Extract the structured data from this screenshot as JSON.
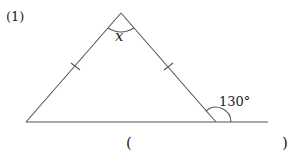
{
  "problem": {
    "number": "(1)",
    "unknown_label": "x",
    "exterior_angle": "130°",
    "answer_open": "(",
    "answer_close": ")"
  },
  "figure": {
    "type": "isosceles-triangle",
    "equal_sides_marked": true,
    "color": "#555555"
  }
}
